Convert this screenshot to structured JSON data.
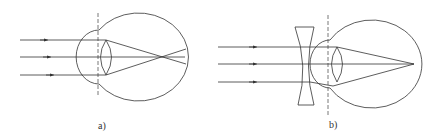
{
  "figure": {
    "panels": [
      {
        "id": "a",
        "label": "a)",
        "description": "Myopic eye: parallel rays focus in front of the retina"
      },
      {
        "id": "b",
        "label": "b)",
        "description": "Myopia corrected with concave (diverging) lens: rays focus on the retina"
      }
    ],
    "colors": {
      "stroke": "#333333",
      "dashed": "#555555",
      "background": "#ffffff"
    }
  }
}
